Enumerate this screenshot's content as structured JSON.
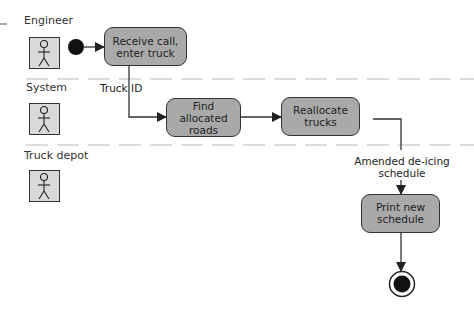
{
  "diagram": {
    "type": "UML activity diagram with swimlanes",
    "swimlanes": [
      {
        "label": "Engineer"
      },
      {
        "label": "System"
      },
      {
        "label": "Truck depot"
      }
    ],
    "activities": [
      {
        "id": "a1",
        "label_line1": "Receive call,",
        "label_line2": "enter truck",
        "lane": "Engineer"
      },
      {
        "id": "a2",
        "label_line1": "Find",
        "label_line2": "allocated",
        "label_line3": "roads",
        "lane": "System"
      },
      {
        "id": "a3",
        "label_line1": "Reallocate",
        "label_line2": "trucks",
        "lane": "System"
      },
      {
        "id": "a4",
        "label_line1": "Print new",
        "label_line2": "schedule",
        "lane": "Truck depot"
      }
    ],
    "flow_labels": {
      "truck_id": "Truck ID",
      "amended_line1": "Amended de-icing",
      "amended_line2": "schedule"
    },
    "colors": {
      "activity_fill": "#a9a9a9",
      "actor_fill": "#d9d9d9",
      "stroke": "#333333",
      "lane_divider": "#bbbbbb"
    }
  }
}
